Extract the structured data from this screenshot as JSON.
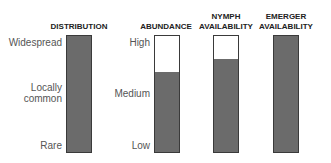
{
  "chart_data": {
    "type": "bar",
    "title": "",
    "categories": [
      "DISTRIBUTION",
      "ABUNDANCE",
      "NYMPH AVAILABILITY",
      "EMERGER AVAILABILITY"
    ],
    "values": [
      100,
      69,
      80,
      100
    ],
    "ylim": [
      0,
      100
    ],
    "scales": {
      "distribution": [
        "Rare",
        "Locally common",
        "Widespread"
      ],
      "abundance": [
        "Low",
        "Medium",
        "High"
      ]
    },
    "grid": false,
    "legend": "none"
  },
  "labels": {
    "distribution": "DISTRIBUTION",
    "abundance": "ABUNDANCE",
    "nymph": "NYMPH\nAVAILABILITY",
    "emerger": "EMERGER\nAVAILABILITY"
  },
  "ticks": {
    "widespread": "Widespread",
    "locally": "Locally\ncommon",
    "rare": "Rare",
    "high": "High",
    "medium": "Medium",
    "low": "Low"
  },
  "colors": {
    "fill": "#6b6b6b",
    "border": "#3a3a3a"
  }
}
